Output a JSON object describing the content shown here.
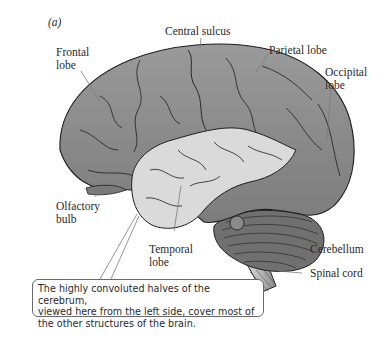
{
  "figure": {
    "panel_label": "(a)",
    "labels": {
      "central_sulcus": "Central sulcus",
      "frontal_lobe_line1": "Frontal",
      "frontal_lobe_line2": "lobe",
      "parietal_lobe": "Parietal lobe",
      "occipital_lobe_line1": "Occipital",
      "occipital_lobe_line2": "lobe",
      "olfactory_bulb_line1": "Olfactory",
      "olfactory_bulb_line2": "bulb",
      "temporal_lobe_line1": "Temporal",
      "temporal_lobe_line2": "lobe",
      "cerebellum": "Cerebellum",
      "spinal_cord": "Spinal cord"
    },
    "callout": {
      "line1": "The highly convoluted halves of the cerebrum,",
      "line2": "viewed here from the left side, cover most of",
      "line3": "the other structures of the brain."
    },
    "colors": {
      "cerebrum": "#8c8c8c",
      "temporal_lobe": "#d9d9d9",
      "cerebellum": "#6e6e6e",
      "outline": "#1e1e1e",
      "leader_line": "#7a7a7a"
    }
  }
}
